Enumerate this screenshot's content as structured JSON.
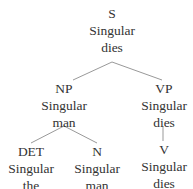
{
  "tree": {
    "nodes": [
      {
        "id": "S",
        "label": "S",
        "feature": "Singular",
        "word": "dies"
      },
      {
        "id": "NP",
        "label": "NP",
        "feature": "Singular",
        "word": "man"
      },
      {
        "id": "VP",
        "label": "VP",
        "feature": "Singular",
        "word": "dies"
      },
      {
        "id": "DET",
        "label": "DET",
        "feature": "Singular",
        "word": "the"
      },
      {
        "id": "N",
        "label": "N",
        "feature": "Singular",
        "word": "man"
      },
      {
        "id": "V",
        "label": "V",
        "feature": "Singular",
        "word": "dies"
      }
    ],
    "edges": [
      [
        "S",
        "NP"
      ],
      [
        "S",
        "VP"
      ],
      [
        "NP",
        "DET"
      ],
      [
        "NP",
        "N"
      ],
      [
        "VP",
        "V"
      ]
    ],
    "line_color": "#999999"
  }
}
